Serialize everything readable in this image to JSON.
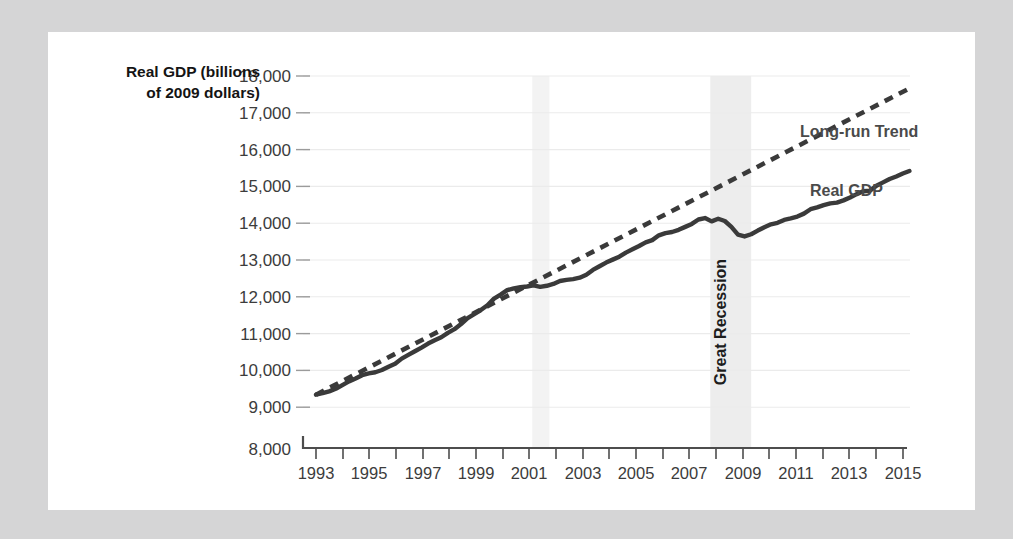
{
  "figure": {
    "background_color": "#d5d5d6",
    "card_color": "#ffffff"
  },
  "labels": {
    "y_axis_title_line1": "Real GDP (billions",
    "y_axis_title_line2": "of 2009 dollars)",
    "trend_label": "Long-run Trend",
    "gdp_label": "Real GDP",
    "recession_label": "Great Recession"
  },
  "colors": {
    "line": "#3a3a3a",
    "grid": "#ebebeb",
    "axis": "#4d4d4d",
    "band": "#ededed",
    "band_faint": "#f3f3f3",
    "tick_text": "#3c3c3c",
    "series_text": "#4a4a4a"
  },
  "chart_data": {
    "type": "line",
    "title": "",
    "xlabel": "",
    "ylabel": "Real GDP (billions of 2009 dollars)",
    "xlim": [
      1993,
      2015.75
    ],
    "ylim": [
      9000,
      18000
    ],
    "y_axis_break_below": 9000,
    "grid": "horizontal",
    "legend": "inline-annotations",
    "yticks": [
      "8,000",
      "9,000",
      "10,000",
      "11,000",
      "12,000",
      "13,000",
      "14,000",
      "15,000",
      "16,000",
      "17,000",
      "18,000"
    ],
    "ytick_values": [
      8000,
      9000,
      10000,
      11000,
      12000,
      13000,
      14000,
      15000,
      16000,
      17000,
      18000
    ],
    "xticks": [
      "1993",
      "1995",
      "1997",
      "1999",
      "2001",
      "2003",
      "2005",
      "2007",
      "2009",
      "2011",
      "2013",
      "2015"
    ],
    "xtick_values": [
      1993,
      1995,
      1997,
      1999,
      2001,
      2003,
      2005,
      2007,
      2009,
      2011,
      2013,
      2015
    ],
    "xtick_minor_values": [
      1994,
      1996,
      1998,
      2000,
      2002,
      2004,
      2006,
      2008,
      2010,
      2012,
      2014
    ],
    "shaded_bands": [
      {
        "name": "2001 Recession",
        "start": 2001.2,
        "end": 2001.85,
        "color": "#f3f3f3",
        "labeled": false
      },
      {
        "name": "Great Recession",
        "start": 2007.95,
        "end": 2009.5,
        "color": "#ededed",
        "labeled": true
      }
    ],
    "annotations": [
      {
        "text": "Long-run Trend",
        "x": 2011.6,
        "y": 16450
      },
      {
        "text": "Real GDP",
        "x": 2011.9,
        "y": 14850
      },
      {
        "text": "Great Recession",
        "x": 2008.7,
        "y": 11600,
        "rotation": -90
      }
    ],
    "series": [
      {
        "name": "Real GDP",
        "style": "solid",
        "x": [
          1993.0,
          1993.25,
          1993.5,
          1993.75,
          1994.0,
          1994.25,
          1994.5,
          1994.75,
          1995.0,
          1995.25,
          1995.5,
          1995.75,
          1996.0,
          1996.25,
          1996.5,
          1996.75,
          1997.0,
          1997.25,
          1997.5,
          1997.75,
          1998.0,
          1998.25,
          1998.5,
          1998.75,
          1999.0,
          1999.25,
          1999.5,
          1999.75,
          2000.0,
          2000.25,
          2000.5,
          2000.75,
          2001.0,
          2001.25,
          2001.5,
          2001.75,
          2002.0,
          2002.25,
          2002.5,
          2002.75,
          2003.0,
          2003.25,
          2003.5,
          2003.75,
          2004.0,
          2004.25,
          2004.5,
          2004.75,
          2005.0,
          2005.25,
          2005.5,
          2005.75,
          2006.0,
          2006.25,
          2006.5,
          2006.75,
          2007.0,
          2007.25,
          2007.5,
          2007.75,
          2008.0,
          2008.25,
          2008.5,
          2008.75,
          2009.0,
          2009.25,
          2009.5,
          2009.75,
          2010.0,
          2010.25,
          2010.5,
          2010.75,
          2011.0,
          2011.25,
          2011.5,
          2011.75,
          2012.0,
          2012.25,
          2012.5,
          2012.75,
          2013.0,
          2013.25,
          2013.5,
          2013.75,
          2014.0,
          2014.25,
          2014.5,
          2014.75,
          2015.0,
          2015.25,
          2015.5
        ],
        "y": [
          9340,
          9380,
          9430,
          9500,
          9600,
          9700,
          9780,
          9870,
          9920,
          9950,
          10010,
          10100,
          10180,
          10320,
          10420,
          10520,
          10620,
          10730,
          10820,
          10900,
          11020,
          11120,
          11260,
          11420,
          11530,
          11640,
          11770,
          11950,
          12060,
          12180,
          12230,
          12260,
          12280,
          12310,
          12270,
          12300,
          12350,
          12430,
          12460,
          12480,
          12520,
          12600,
          12730,
          12830,
          12930,
          13010,
          13090,
          13200,
          13290,
          13380,
          13480,
          13540,
          13670,
          13730,
          13760,
          13820,
          13900,
          13980,
          14100,
          14140,
          14050,
          14120,
          14060,
          13900,
          13690,
          13640,
          13700,
          13800,
          13890,
          13970,
          14010,
          14090,
          14130,
          14180,
          14260,
          14380,
          14430,
          14490,
          14540,
          14560,
          14620,
          14700,
          14790,
          14870,
          14880,
          15020,
          15110,
          15200,
          15270,
          15350,
          15420
        ]
      },
      {
        "name": "Long-run Trend",
        "style": "dashed",
        "x": [
          1993.0,
          2015.6
        ],
        "y": [
          9340,
          17700
        ]
      }
    ]
  }
}
